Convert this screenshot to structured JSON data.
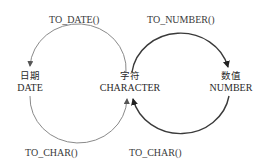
{
  "nodes": {
    "date": {
      "zh": "日期",
      "en": "DATE"
    },
    "character": {
      "zh": "字符",
      "en": "CHARACTER"
    },
    "number": {
      "zh": "数值",
      "en": "NUMBER"
    }
  },
  "edges": {
    "char_to_date": {
      "label": "TO_DATE()"
    },
    "char_to_number": {
      "label": "TO_NUMBER()"
    },
    "date_to_char": {
      "label": "TO_CHAR()"
    },
    "number_to_char": {
      "label": "TO_CHAR()"
    }
  },
  "colors": {
    "left_cycle": "#8a8a8a",
    "right_cycle": "#3a3a3a",
    "text": "#333333"
  }
}
